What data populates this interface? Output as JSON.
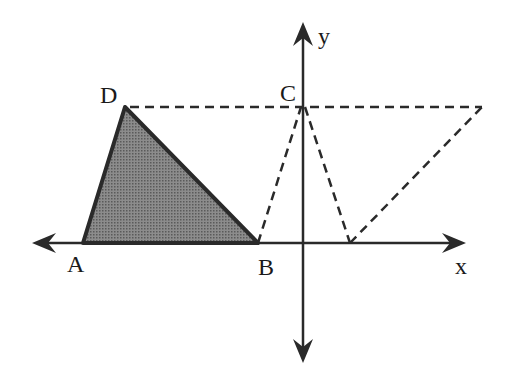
{
  "diagram": {
    "axes": {
      "x_label": "x",
      "y_label": "y"
    },
    "points": {
      "A": "A",
      "B": "B",
      "C": "C",
      "D": "D"
    },
    "colors": {
      "stroke": "#2a2a2a",
      "fill": "#7a7a7a",
      "background": "#ffffff"
    }
  }
}
